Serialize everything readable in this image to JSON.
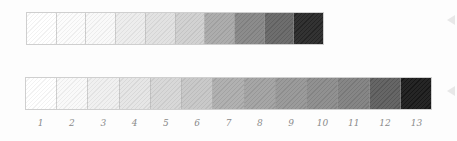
{
  "scales": {
    "top": {
      "cells": [
        "#ffffff",
        "#fcfcfc",
        "#f9f9f9",
        "#ececec",
        "#e0e0e0",
        "#cfcfcf",
        "#a8a8a8",
        "#858585",
        "#656565",
        "#262626"
      ]
    },
    "bottom": {
      "cells": [
        "#ffffff",
        "#f9f9f9",
        "#efefef",
        "#e4e4e4",
        "#d6d6d6",
        "#c6c6c6",
        "#acacac",
        "#a0a0a0",
        "#959595",
        "#8a8a8a",
        "#7e7e7e",
        "#5c5c5c",
        "#181818"
      ],
      "labels": [
        "1",
        "2",
        "3",
        "4",
        "5",
        "6",
        "7",
        "8",
        "9",
        "10",
        "11",
        "12",
        "13"
      ]
    }
  },
  "markers": [
    {
      "x": 447,
      "y": 15
    },
    {
      "x": 447,
      "y": 86
    }
  ]
}
